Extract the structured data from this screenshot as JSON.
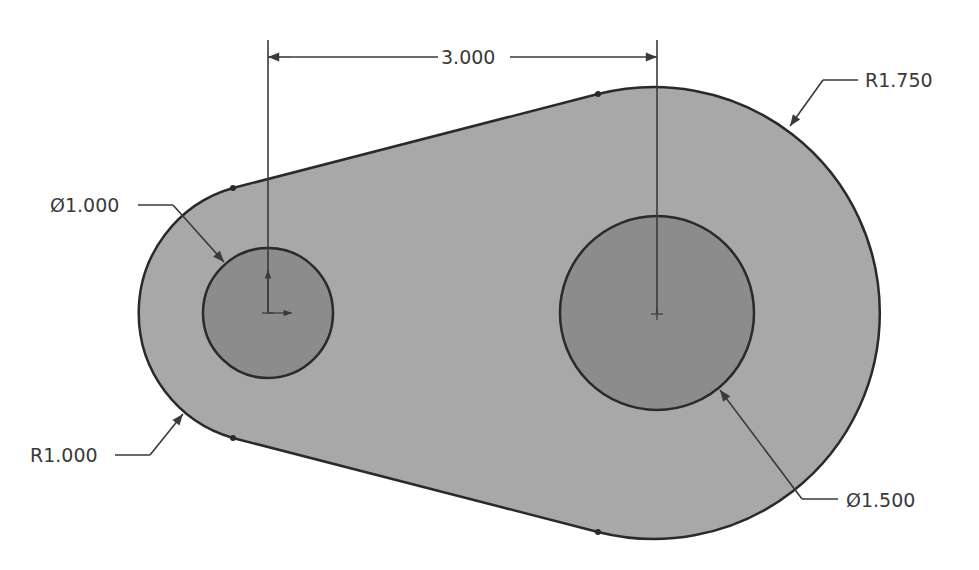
{
  "drawing": {
    "title": "Cam link sketch",
    "colors": {
      "body_fill": "#a8a8a8",
      "hole_fill": "#8c8c8c",
      "outline": "#2a2a2a",
      "dimension": "#3a3a3a",
      "background": "#ffffff"
    },
    "dimensions": {
      "center_distance": "3.000",
      "large_radius": "R1.750",
      "small_hole_diameter": "Ø1.000",
      "small_radius": "R1.000",
      "large_hole_diameter": "Ø1.500"
    }
  }
}
